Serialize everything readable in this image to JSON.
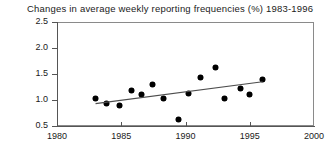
{
  "chart_data": {
    "type": "scatter",
    "title": "Changes in average weekly reporting frequencies (%) 1983-1996",
    "xlabel": "",
    "ylabel": "",
    "xlim": [
      1980,
      2000
    ],
    "ylim": [
      0.5,
      2.5
    ],
    "xticks": [
      1980,
      1985,
      1990,
      1995,
      2000
    ],
    "xtick_labels": [
      "1980",
      "1985",
      "1990",
      "1995",
      "2000"
    ],
    "yticks": [
      0.5,
      1.0,
      1.5,
      2.0,
      2.5
    ],
    "ytick_labels": [
      "0.5",
      "1.0",
      "1.5",
      "2.0",
      "2.5"
    ],
    "grid": false,
    "legend": null,
    "points": [
      {
        "x": 1983.0,
        "y": 1.02
      },
      {
        "x": 1983.9,
        "y": 0.92
      },
      {
        "x": 1984.9,
        "y": 0.88
      },
      {
        "x": 1985.8,
        "y": 1.18
      },
      {
        "x": 1986.6,
        "y": 1.1
      },
      {
        "x": 1987.5,
        "y": 1.28
      },
      {
        "x": 1988.3,
        "y": 1.02
      },
      {
        "x": 1989.5,
        "y": 0.62
      },
      {
        "x": 1990.3,
        "y": 1.12
      },
      {
        "x": 1991.2,
        "y": 1.42
      },
      {
        "x": 1992.4,
        "y": 1.62
      },
      {
        "x": 1993.1,
        "y": 1.02
      },
      {
        "x": 1994.3,
        "y": 1.22
      },
      {
        "x": 1995.0,
        "y": 1.1
      },
      {
        "x": 1996.0,
        "y": 1.38
      }
    ],
    "trend_line": {
      "x_start": 1983.0,
      "y_start": 0.93,
      "x_end": 1996.0,
      "y_end": 1.35
    }
  },
  "colors": {
    "marker": "#000000",
    "trend": "#4d4d4d",
    "axis": "#555555",
    "frame": "#8a8a8a",
    "text": "#1a1a1a"
  }
}
